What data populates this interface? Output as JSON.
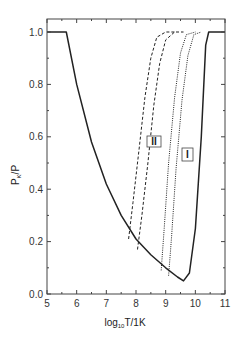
{
  "chart_data": {
    "type": "line",
    "title": "",
    "xlabel": "log10 T/1K",
    "ylabel": "P_K/P",
    "xlim": [
      5,
      11
    ],
    "ylim": [
      0,
      1.05
    ],
    "grid": false,
    "x_ticks": [
      "5",
      "6",
      "7",
      "8",
      "9",
      "10",
      "11"
    ],
    "y_ticks": [
      "0.0",
      "0.2",
      "0.4",
      "0.6",
      "0.8",
      "1.0"
    ],
    "annotations": [
      "II",
      "I"
    ],
    "series": [
      {
        "name": "envelope (solid)",
        "style": "solid",
        "x": [
          5.0,
          5.65,
          6.0,
          6.5,
          7.0,
          7.5,
          8.0,
          8.5,
          9.0,
          9.4,
          9.6,
          9.8,
          10.0,
          10.2,
          10.35,
          10.45,
          11.0
        ],
        "y": [
          1.0,
          1.0,
          0.8,
          0.58,
          0.42,
          0.3,
          0.21,
          0.15,
          0.1,
          0.065,
          0.05,
          0.08,
          0.25,
          0.6,
          0.95,
          1.0,
          1.0
        ]
      },
      {
        "name": "II curve a (dashed)",
        "style": "dashed",
        "x": [
          7.75,
          7.9,
          8.1,
          8.3,
          8.5,
          8.7,
          9.0,
          9.3
        ],
        "y": [
          0.21,
          0.35,
          0.55,
          0.75,
          0.9,
          0.98,
          1.0,
          1.0
        ]
      },
      {
        "name": "II curve b (dashed)",
        "style": "dashed",
        "x": [
          8.05,
          8.2,
          8.4,
          8.6,
          8.8,
          9.0,
          9.3,
          9.6
        ],
        "y": [
          0.17,
          0.3,
          0.5,
          0.72,
          0.88,
          0.97,
          1.0,
          1.0
        ]
      },
      {
        "name": "I curve a (dotted)",
        "style": "dotted",
        "x": [
          8.85,
          8.95,
          9.1,
          9.3,
          9.5,
          9.7,
          10.0
        ],
        "y": [
          0.09,
          0.25,
          0.5,
          0.75,
          0.92,
          0.99,
          1.0
        ]
      },
      {
        "name": "I curve b (dotted)",
        "style": "dotted",
        "x": [
          9.1,
          9.2,
          9.35,
          9.55,
          9.75,
          9.95,
          10.2
        ],
        "y": [
          0.07,
          0.22,
          0.48,
          0.74,
          0.91,
          0.99,
          1.0
        ]
      }
    ]
  }
}
